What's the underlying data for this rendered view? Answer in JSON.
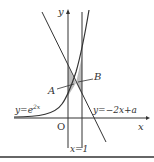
{
  "diagram": {
    "axis_x_label": "x",
    "axis_y_label": "y",
    "origin_label": "O",
    "curve_label": "y=e",
    "curve_exponent": "2x",
    "line_label": "y=−2x+a",
    "vertical_label": "x=1",
    "point_a_label": "A",
    "point_b_label": "B",
    "colors": {
      "stroke": "#333333",
      "shade": "#b8b8b8",
      "border": "#666666"
    }
  }
}
